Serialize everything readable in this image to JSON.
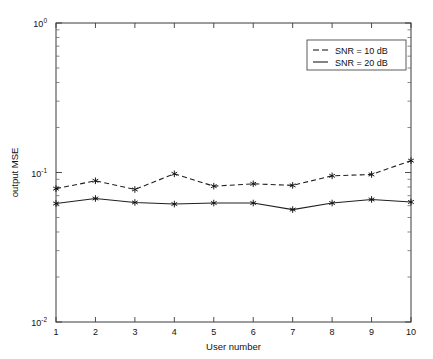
{
  "chart_data": {
    "type": "line",
    "title": "",
    "xlabel": "User number",
    "ylabel": "output MSE",
    "xlim": [
      1,
      10
    ],
    "ylim": [
      0.01,
      1
    ],
    "yscale": "log",
    "xscale": "linear",
    "grid": false,
    "legend_position": "top-right",
    "x": [
      1,
      2,
      3,
      4,
      5,
      6,
      7,
      8,
      9,
      10
    ],
    "xticklabels": [
      "1",
      "2",
      "3",
      "4",
      "5",
      "6",
      "7",
      "8",
      "9",
      "10"
    ],
    "yticklabels": [
      "10",
      "10",
      "10"
    ],
    "ytick_exponents": [
      "0",
      "-1",
      "-2"
    ],
    "ytickvalues": [
      1,
      0.1,
      0.01
    ],
    "series": [
      {
        "name": "SNR = 10 dB",
        "style": "dashed",
        "marker": "asterisk",
        "color": "#202020",
        "values": [
          0.078,
          0.088,
          0.077,
          0.098,
          0.081,
          0.084,
          0.082,
          0.095,
          0.097,
          0.12
        ]
      },
      {
        "name": "SNR = 20 dB",
        "style": "solid",
        "marker": "asterisk",
        "color": "#202020",
        "values": [
          0.062,
          0.067,
          0.063,
          0.0615,
          0.0625,
          0.0625,
          0.0565,
          0.0625,
          0.066,
          0.0635
        ]
      }
    ]
  },
  "legend": {
    "entries": [
      {
        "label": "SNR = 10 dB",
        "style": "dashed"
      },
      {
        "label": "SNR = 20 dB",
        "style": "solid"
      }
    ]
  },
  "axes": {
    "x_title": "User number",
    "y_title": "output MSE",
    "y_base": "10"
  }
}
